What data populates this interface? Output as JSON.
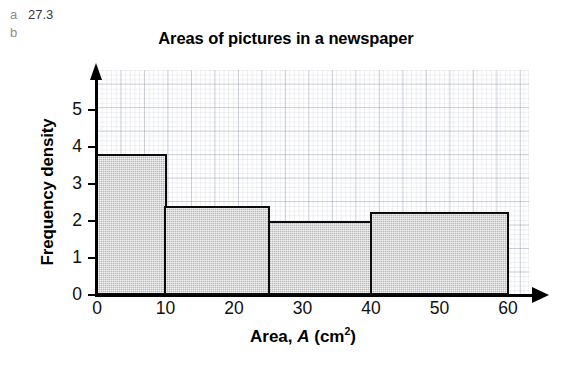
{
  "answer_markers": [
    {
      "label": "a",
      "value": "27.3"
    },
    {
      "label": "b",
      "value": ""
    }
  ],
  "chart_data": {
    "type": "bar",
    "title": "Areas of pictures in a newspaper",
    "xlabel_prefix": "Area, ",
    "xlabel_variable": "A",
    "xlabel_units_open": " (cm",
    "xlabel_units_exp": "2",
    "xlabel_units_close": ")",
    "xlabel": "Area, A (cm2)",
    "ylabel": "Frequency density",
    "xlim": [
      0,
      60
    ],
    "ylim": [
      0,
      5.6
    ],
    "xticks": [
      0,
      10,
      20,
      30,
      40,
      50,
      60
    ],
    "xtick_labels": [
      "0",
      "10",
      "20",
      "30",
      "40",
      "50",
      "60"
    ],
    "yticks": [
      0,
      1,
      2,
      3,
      4,
      5
    ],
    "ytick_labels": [
      "0",
      "1",
      "2",
      "3",
      "4",
      "5"
    ],
    "grid": true,
    "grid_style": "graph-paper",
    "legend": null,
    "bar_fill_color": "#b9b9b9",
    "bar_edge_color": "#0c0c0c",
    "bins": [
      {
        "start": 0,
        "end": 10,
        "frequency_density": 3.8,
        "frequency": 38
      },
      {
        "start": 10,
        "end": 25,
        "frequency_density": 2.4,
        "frequency": 36
      },
      {
        "start": 25,
        "end": 40,
        "frequency_density": 2.0,
        "frequency": 30
      },
      {
        "start": 40,
        "end": 60,
        "frequency_density": 2.25,
        "frequency": 45
      }
    ],
    "categories": [
      "0-10",
      "10-25",
      "25-40",
      "40-60"
    ],
    "values": [
      3.8,
      2.4,
      2.0,
      2.25
    ]
  }
}
